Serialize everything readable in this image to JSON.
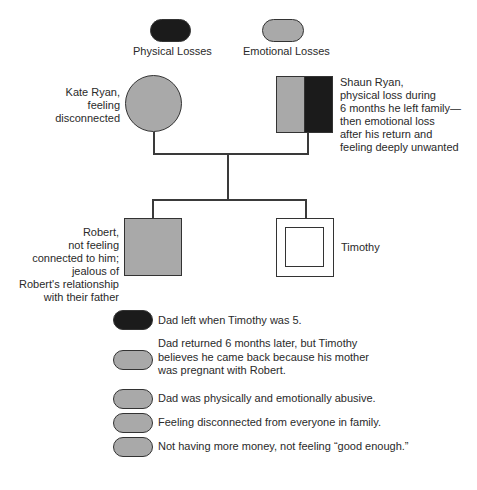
{
  "legend": {
    "physical": {
      "label": "Physical Losses",
      "color": "#1b1b1b"
    },
    "emotional": {
      "label": "Emotional Losses",
      "color": "#a9a9a9"
    }
  },
  "family": {
    "mother": {
      "name": "Kate Ryan",
      "lines": [
        "Kate Ryan,",
        "feeling",
        "disconnected"
      ],
      "symbol": "circle",
      "loss": "emotional"
    },
    "father": {
      "name": "Shaun Ryan",
      "lines": [
        "Shaun Ryan,",
        "physical loss during",
        "6 months he left family—",
        "then emotional loss",
        "after his return and",
        "feeling deeply unwanted"
      ],
      "symbol": "square",
      "loss": "emotional+physical"
    },
    "child1": {
      "name": "Robert",
      "lines": [
        "Robert,",
        "not feeling",
        "connected to him;",
        "jealous of",
        "Robert's relationship",
        "with their father"
      ],
      "symbol": "square",
      "loss": "emotional"
    },
    "child2": {
      "name": "Timothy",
      "lines": [
        "Timothy"
      ],
      "symbol": "double-square",
      "loss": "none"
    }
  },
  "losses": [
    {
      "type": "physical",
      "text": "Dad left when Timothy was 5."
    },
    {
      "type": "emotional",
      "lines": [
        "Dad returned 6 months later, but Timothy",
        "believes he came back because his mother",
        "was pregnant with Robert."
      ]
    },
    {
      "type": "emotional",
      "text": "Dad was physically and emotionally abusive."
    },
    {
      "type": "emotional",
      "text": "Feeling disconnected from everyone in family."
    },
    {
      "type": "emotional",
      "text": "Not having more money, not feeling “good enough.”"
    }
  ]
}
